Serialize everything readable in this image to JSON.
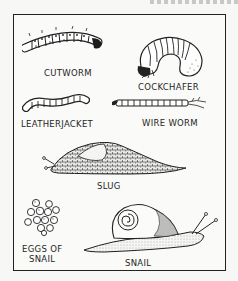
{
  "plate": {
    "labels": {
      "cutworm": "CUTWORM",
      "cockchafer": "COCKCHAFER",
      "leatherjacket": "LEATHERJACKET",
      "wire_worm": "WIRE WORM",
      "slug": "SLUG",
      "eggs_line1": "EGGS OF",
      "eggs_line2": "SNAIL",
      "snail": "SNAIL"
    }
  }
}
